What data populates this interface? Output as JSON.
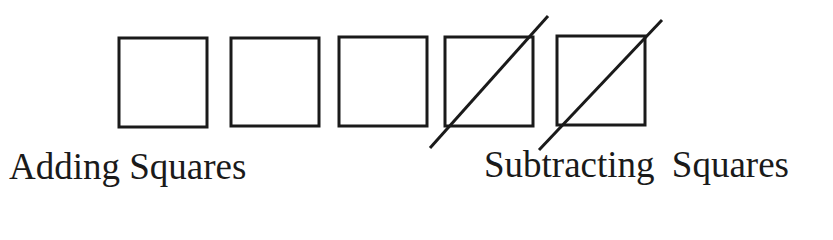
{
  "diagram": {
    "stroke_color": "#1a1a1a",
    "background": "#ffffff",
    "squares": [
      {
        "id": 1,
        "x": 119,
        "y": 38,
        "size": 88,
        "crossed": false
      },
      {
        "id": 2,
        "x": 231,
        "y": 38,
        "size": 88,
        "crossed": false
      },
      {
        "id": 3,
        "x": 339,
        "y": 37,
        "size": 88,
        "crossed": false
      },
      {
        "id": 4,
        "x": 445,
        "y": 37,
        "size": 88,
        "crossed": true
      },
      {
        "id": 5,
        "x": 557,
        "y": 36,
        "size": 88,
        "crossed": true
      }
    ],
    "slashes": [
      {
        "x1": 430,
        "y1": 148,
        "x2": 548,
        "y2": 16
      },
      {
        "x1": 539,
        "y1": 150,
        "x2": 662,
        "y2": 20
      }
    ],
    "labels": {
      "adding": "Adding Squares",
      "subtracting": "Subtracting Squares"
    }
  }
}
